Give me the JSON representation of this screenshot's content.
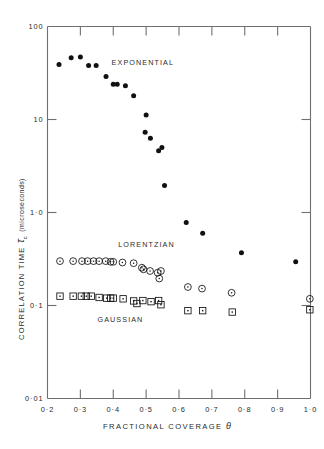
{
  "chart_data": {
    "type": "scatter",
    "title": "",
    "xlabel": "FRACTIONAL COVERAGE θ",
    "ylabel": "CORRELATION TIME τc (microseconds)",
    "ylabel_parts": {
      "prefix": "CORRELATION TIME",
      "symbol": "τ",
      "subscript": "c",
      "units": "(microseconds)"
    },
    "xlabel_parts": {
      "prefix": "FRACTIONAL  COVERAGE",
      "symbol": "θ"
    },
    "xscale": "linear",
    "yscale": "log",
    "xlim": [
      0.2,
      1.0
    ],
    "ylim": [
      0.01,
      100
    ],
    "grid": false,
    "legend_position": "inline-annotations",
    "xticks": [
      0.2,
      0.3,
      0.4,
      0.5,
      0.6,
      0.7,
      0.8,
      0.9,
      1.0
    ],
    "xticklabels": [
      "0·2",
      "0·3",
      "0·4",
      "0·5",
      "0·6",
      "0·7",
      "0·8",
      "0·9",
      "1·0"
    ],
    "yticks": [
      0.01,
      0.1,
      1.0,
      10,
      100
    ],
    "yticklabels": [
      "0·01",
      "0·1",
      "1·0",
      "10",
      "100"
    ],
    "series": [
      {
        "name": "EXPONENTIAL",
        "marker": "filled-circle",
        "color": "#111111",
        "label_xy": [
          0.395,
          42
        ],
        "points": [
          [
            0.235,
            39
          ],
          [
            0.272,
            46
          ],
          [
            0.3,
            47
          ],
          [
            0.325,
            38
          ],
          [
            0.348,
            38
          ],
          [
            0.378,
            29
          ],
          [
            0.4,
            24
          ],
          [
            0.412,
            24
          ],
          [
            0.437,
            23
          ],
          [
            0.462,
            18
          ],
          [
            0.5,
            11.2
          ],
          [
            0.497,
            7.3
          ],
          [
            0.513,
            6.3
          ],
          [
            0.538,
            4.6
          ],
          [
            0.548,
            5.0
          ],
          [
            0.556,
            1.95
          ],
          [
            0.622,
            0.78
          ],
          [
            0.672,
            0.6
          ],
          [
            0.79,
            0.37
          ],
          [
            0.955,
            0.295
          ]
        ]
      },
      {
        "name": "LORENTZIAN",
        "marker": "open-circle",
        "color": "#111111",
        "label_xy": [
          0.415,
          0.46
        ],
        "points": [
          [
            0.238,
            0.3
          ],
          [
            0.278,
            0.3
          ],
          [
            0.305,
            0.3
          ],
          [
            0.322,
            0.3
          ],
          [
            0.34,
            0.3
          ],
          [
            0.357,
            0.3
          ],
          [
            0.377,
            0.3
          ],
          [
            0.392,
            0.295
          ],
          [
            0.4,
            0.295
          ],
          [
            0.428,
            0.29
          ],
          [
            0.462,
            0.285
          ],
          [
            0.487,
            0.255
          ],
          [
            0.492,
            0.245
          ],
          [
            0.512,
            0.235
          ],
          [
            0.535,
            0.225
          ],
          [
            0.545,
            0.235
          ],
          [
            0.54,
            0.195
          ],
          [
            0.627,
            0.158
          ],
          [
            0.67,
            0.152
          ],
          [
            0.76,
            0.137
          ],
          [
            0.998,
            0.118
          ]
        ]
      },
      {
        "name": "GAUSSIAN",
        "marker": "open-square",
        "color": "#111111",
        "label_xy": [
          0.352,
          0.072
        ],
        "points": [
          [
            0.238,
            0.126
          ],
          [
            0.278,
            0.126
          ],
          [
            0.303,
            0.126
          ],
          [
            0.318,
            0.126
          ],
          [
            0.333,
            0.126
          ],
          [
            0.357,
            0.122
          ],
          [
            0.38,
            0.12
          ],
          [
            0.392,
            0.12
          ],
          [
            0.4,
            0.12
          ],
          [
            0.43,
            0.118
          ],
          [
            0.462,
            0.112
          ],
          [
            0.472,
            0.105
          ],
          [
            0.49,
            0.113
          ],
          [
            0.515,
            0.11
          ],
          [
            0.538,
            0.113
          ],
          [
            0.545,
            0.102
          ],
          [
            0.627,
            0.088
          ],
          [
            0.672,
            0.088
          ],
          [
            0.762,
            0.085
          ],
          [
            0.998,
            0.09
          ]
        ]
      }
    ]
  },
  "annotations": [
    {
      "id": "exponential",
      "text": "EXPONENTIAL"
    },
    {
      "id": "lorentzian",
      "text": "LORENTZIAN"
    },
    {
      "id": "gaussian",
      "text": "GAUSSIAN"
    }
  ],
  "axes": {
    "x_title_prefix": "FRACTIONAL  COVERAGE",
    "x_title_symbol": "θ",
    "y_title_prefix": "CORRELATION TIME",
    "y_title_symbol": "τ",
    "y_title_subscript": "c",
    "y_title_units": "(microseconds)"
  },
  "colors": {
    "axis": "#6f6f6f",
    "marker": "#111111",
    "text": "#2b2b2b",
    "background": "#ffffff"
  }
}
